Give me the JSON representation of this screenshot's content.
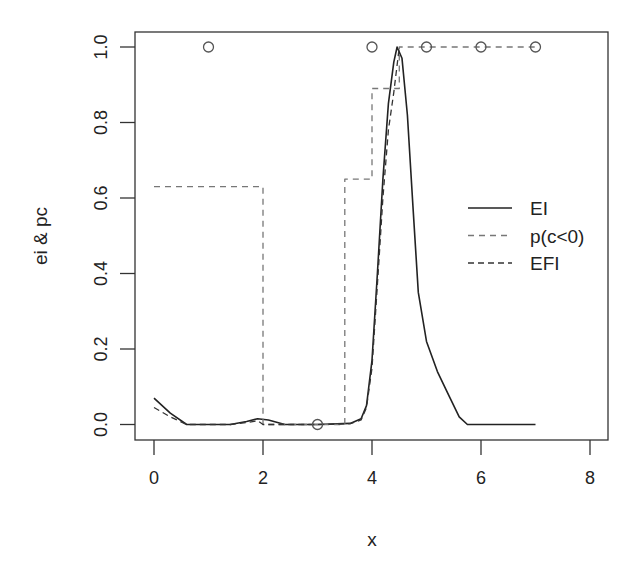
{
  "chart_data": {
    "type": "line",
    "title": "",
    "xlabel": "x",
    "ylabel": "ei & pc",
    "xlim": [
      -0.4,
      8.4
    ],
    "ylim": [
      -0.04,
      1.04
    ],
    "x_ticks": [
      "0",
      "2",
      "4",
      "6",
      "8"
    ],
    "y_ticks": [
      "0.0",
      "0.2",
      "0.4",
      "0.6",
      "0.8",
      "1.0"
    ],
    "grid": false,
    "legend_position": "right-center",
    "legend": [
      "EI",
      "p(c<0)",
      "EFI"
    ],
    "series": [
      {
        "name": "EI",
        "style": "solid",
        "color": "#222222",
        "x": [
          0,
          0.3,
          0.6,
          1.4,
          1.7,
          1.9,
          2.1,
          2.4,
          3.0,
          3.6,
          3.8,
          3.9,
          4.0,
          4.1,
          4.2,
          4.3,
          4.4,
          4.46,
          4.55,
          4.65,
          4.75,
          4.85,
          5.0,
          5.2,
          5.4,
          5.6,
          5.75,
          7.0
        ],
        "y": [
          0.07,
          0.03,
          0.0,
          0.0,
          0.008,
          0.015,
          0.012,
          0.0,
          0.0,
          0.003,
          0.015,
          0.05,
          0.17,
          0.4,
          0.65,
          0.85,
          0.96,
          1.0,
          0.97,
          0.82,
          0.58,
          0.35,
          0.22,
          0.14,
          0.08,
          0.02,
          0.0,
          0.0
        ]
      },
      {
        "name": "p(c<0)",
        "style": "dashed",
        "color": "#777777",
        "x": [
          0,
          2,
          2,
          3.5,
          3.5,
          4.0,
          4.0,
          4.5,
          4.5,
          7.0
        ],
        "y": [
          0.63,
          0.63,
          0.0,
          0.0,
          0.65,
          0.65,
          0.89,
          0.89,
          1.0,
          1.0
        ]
      },
      {
        "name": "EFI",
        "style": "dashed",
        "color": "#333333",
        "x": [
          0,
          0.3,
          0.6,
          1.4,
          1.7,
          1.9,
          2.0,
          2.4,
          3.0,
          3.6,
          3.8,
          3.9,
          4.0,
          4.1,
          4.2,
          4.3,
          4.4,
          4.5
        ],
        "y": [
          0.045,
          0.02,
          0.0,
          0.0,
          0.005,
          0.01,
          0.0,
          0.0,
          0.0,
          0.002,
          0.012,
          0.045,
          0.15,
          0.37,
          0.6,
          0.78,
          0.88,
          1.0
        ]
      }
    ],
    "points": {
      "marker": "open-circle",
      "x": [
        1,
        3,
        4,
        5,
        6,
        7
      ],
      "y": [
        1,
        0,
        1,
        1,
        1,
        1
      ]
    }
  }
}
